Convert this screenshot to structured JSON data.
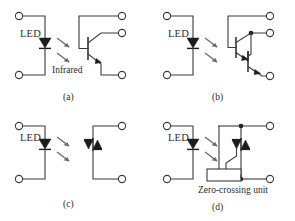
{
  "figure": {
    "background_color": "#ffffff",
    "line_color": "#3a3a3a",
    "symbol_color": "#1c1c1c",
    "ray_color": "#6b6b6b"
  },
  "panels": [
    {
      "id": "a",
      "caption": "(a)",
      "input_label": "LED",
      "light_label": "Infrared",
      "output_device": "phototransistor",
      "terminal_count": 5
    },
    {
      "id": "b",
      "caption": "(b)",
      "input_label": "LED",
      "light_label": "",
      "output_device": "photo-darlington",
      "terminal_count": 5
    },
    {
      "id": "c",
      "caption": "(c)",
      "input_label": "LED",
      "light_label": "",
      "output_device": "photo-triac",
      "terminal_count": 4
    },
    {
      "id": "d",
      "caption": "(d)",
      "input_label": "LED",
      "light_label": "",
      "output_device": "zero-crossing photo-triac",
      "block_label": "Zero-crossing unit",
      "terminal_count": 4
    }
  ]
}
